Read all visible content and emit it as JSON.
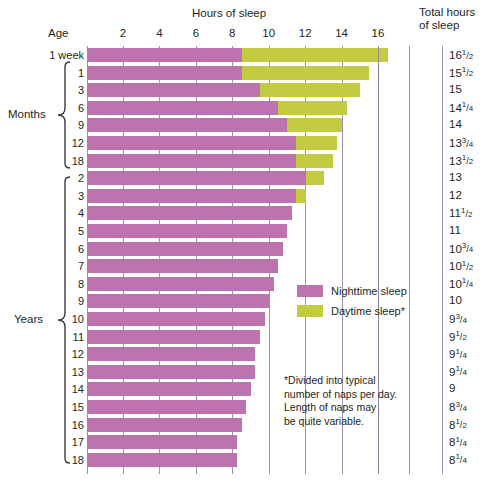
{
  "chart_data": {
    "type": "bar",
    "title": "Hours of sleep",
    "subtitle": "",
    "xlabel": "Hours of sleep",
    "ylabel": "Age",
    "xlim": [
      0,
      17.5
    ],
    "xticks": [
      2,
      4,
      6,
      8,
      10,
      12,
      14,
      16
    ],
    "grid": true,
    "orientation": "horizontal",
    "stacked": true,
    "legend_position": "inside-right",
    "series": [
      {
        "name": "Nighttime sleep",
        "color": "#bd73ad",
        "values": [
          8.5,
          8.5,
          9.5,
          10.5,
          11.0,
          11.5,
          11.5,
          12.0,
          11.5,
          11.25,
          11.0,
          10.75,
          10.5,
          10.25,
          10.0,
          9.75,
          9.5,
          9.25,
          9.25,
          9.0,
          8.75,
          8.5,
          8.25,
          8.25
        ]
      },
      {
        "name": "Daytime sleep*",
        "color": "#c3cc41",
        "values": [
          8.0,
          7.0,
          5.5,
          3.75,
          3.0,
          2.25,
          2.0,
          1.0,
          0.5,
          0,
          0,
          0,
          0,
          0,
          0,
          0,
          0,
          0,
          0,
          0,
          0,
          0,
          0,
          0
        ]
      }
    ],
    "categories": [
      "1 week",
      "1",
      "3",
      "6",
      "9",
      "12",
      "18",
      "2",
      "3",
      "4",
      "5",
      "6",
      "7",
      "8",
      "9",
      "10",
      "11",
      "12",
      "13",
      "14",
      "15",
      "16",
      "17",
      "18"
    ],
    "total_hours": [
      "16½",
      "15½",
      "15",
      "14¼",
      "14",
      "13¾",
      "13½",
      "13",
      "12",
      "11½",
      "11",
      "10¾",
      "10½",
      "10¼",
      "10",
      "9¾",
      "9½",
      "9¼",
      "9¼",
      "9",
      "8¾",
      "8½",
      "8¼",
      "8¼"
    ]
  },
  "header": {
    "hours_title": "Hours of sleep",
    "total_title_line1": "Total hours",
    "total_title_line2": "of sleep",
    "age_label": "Age"
  },
  "xaxis": {
    "ticks": [
      "2",
      "4",
      "6",
      "8",
      "10",
      "12",
      "14",
      "16"
    ]
  },
  "rows": [
    {
      "age": "1 week",
      "night": 8.5,
      "day": 8.0,
      "total_whole": "16",
      "total_num": "1",
      "total_den": "2"
    },
    {
      "age": "1",
      "night": 8.5,
      "day": 7.0,
      "total_whole": "15",
      "total_num": "1",
      "total_den": "2"
    },
    {
      "age": "3",
      "night": 9.5,
      "day": 5.5,
      "total_whole": "15",
      "total_num": "",
      "total_den": ""
    },
    {
      "age": "6",
      "night": 10.5,
      "day": 3.75,
      "total_whole": "14",
      "total_num": "1",
      "total_den": "4"
    },
    {
      "age": "9",
      "night": 11.0,
      "day": 3.0,
      "total_whole": "14",
      "total_num": "",
      "total_den": ""
    },
    {
      "age": "12",
      "night": 11.5,
      "day": 2.25,
      "total_whole": "13",
      "total_num": "3",
      "total_den": "4"
    },
    {
      "age": "18",
      "night": 11.5,
      "day": 2.0,
      "total_whole": "13",
      "total_num": "1",
      "total_den": "2"
    },
    {
      "age": "2",
      "night": 12.0,
      "day": 1.0,
      "total_whole": "13",
      "total_num": "",
      "total_den": ""
    },
    {
      "age": "3",
      "night": 11.5,
      "day": 0.5,
      "total_whole": "12",
      "total_num": "",
      "total_den": ""
    },
    {
      "age": "4",
      "night": 11.25,
      "day": 0,
      "total_whole": "11",
      "total_num": "1",
      "total_den": "2"
    },
    {
      "age": "5",
      "night": 11.0,
      "day": 0,
      "total_whole": "11",
      "total_num": "",
      "total_den": ""
    },
    {
      "age": "6",
      "night": 10.75,
      "day": 0,
      "total_whole": "10",
      "total_num": "3",
      "total_den": "4"
    },
    {
      "age": "7",
      "night": 10.5,
      "day": 0,
      "total_whole": "10",
      "total_num": "1",
      "total_den": "2"
    },
    {
      "age": "8",
      "night": 10.25,
      "day": 0,
      "total_whole": "10",
      "total_num": "1",
      "total_den": "4"
    },
    {
      "age": "9",
      "night": 10.0,
      "day": 0,
      "total_whole": "10",
      "total_num": "",
      "total_den": ""
    },
    {
      "age": "10",
      "night": 9.75,
      "day": 0,
      "total_whole": "9",
      "total_num": "3",
      "total_den": "4"
    },
    {
      "age": "11",
      "night": 9.5,
      "day": 0,
      "total_whole": "9",
      "total_num": "1",
      "total_den": "2"
    },
    {
      "age": "12",
      "night": 9.25,
      "day": 0,
      "total_whole": "9",
      "total_num": "1",
      "total_den": "4"
    },
    {
      "age": "13",
      "night": 9.25,
      "day": 0,
      "total_whole": "9",
      "total_num": "1",
      "total_den": "4"
    },
    {
      "age": "14",
      "night": 9.0,
      "day": 0,
      "total_whole": "9",
      "total_num": "",
      "total_den": ""
    },
    {
      "age": "15",
      "night": 8.75,
      "day": 0,
      "total_whole": "8",
      "total_num": "3",
      "total_den": "4"
    },
    {
      "age": "16",
      "night": 8.5,
      "day": 0,
      "total_whole": "8",
      "total_num": "1",
      "total_den": "2"
    },
    {
      "age": "17",
      "night": 8.25,
      "day": 0,
      "total_whole": "8",
      "total_num": "1",
      "total_den": "4"
    },
    {
      "age": "18",
      "night": 8.25,
      "day": 0,
      "total_whole": "8",
      "total_num": "1",
      "total_den": "4"
    }
  ],
  "braces": {
    "months_label": "Months",
    "years_label": "Years"
  },
  "legend": {
    "items": [
      {
        "label": "Nighttime sleep",
        "color": "#bd73ad"
      },
      {
        "label": "Daytime sleep*",
        "color": "#c3cc41"
      }
    ]
  },
  "footnote": {
    "line1": "*Divided into typical",
    "line2": "number of naps per day.",
    "line3": "Length of naps may",
    "line4": "be quite variable."
  },
  "colors": {
    "nighttime": "#bd73ad",
    "daytime": "#c3cc41",
    "gridline": "#8a7fa8",
    "text": "#231f20",
    "background": "#ffffff"
  }
}
